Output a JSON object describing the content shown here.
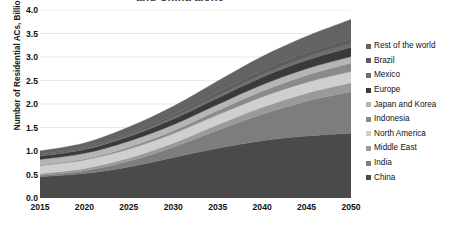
{
  "chart_data": {
    "type": "area",
    "stacked": true,
    "title": "and China alone",
    "title_clipped": true,
    "xlabel": "",
    "ylabel": "Number of Residential ACs, Billions",
    "xlim": [
      2015,
      2050
    ],
    "ylim": [
      0.0,
      4.0
    ],
    "grid": true,
    "legend_position": "right",
    "x": [
      2015,
      2020,
      2025,
      2030,
      2035,
      2040,
      2045,
      2050
    ],
    "xtick_labels": [
      "2015",
      "2020",
      "2025",
      "2030",
      "2035",
      "2040",
      "2045",
      "2050"
    ],
    "ytick_labels": [
      "0.0",
      "0.5",
      "1.0",
      "1.5",
      "2.0",
      "2.5",
      "3.0",
      "3.5",
      "4.0"
    ],
    "ytick_values": [
      0.0,
      0.5,
      1.0,
      1.5,
      2.0,
      2.5,
      3.0,
      3.5,
      4.0
    ],
    "stack_order_bottom_to_top": [
      "China",
      "India",
      "Middle East",
      "North America",
      "Indonesia",
      "Japan and Korea",
      "Europe",
      "Mexico",
      "Brazil",
      "Rest of the world"
    ],
    "series": [
      {
        "name": "China",
        "color": "#4a4a4a",
        "values": [
          0.45,
          0.52,
          0.66,
          0.86,
          1.06,
          1.22,
          1.32,
          1.38
        ]
      },
      {
        "name": "India",
        "color": "#7d7d7d",
        "values": [
          0.03,
          0.06,
          0.12,
          0.22,
          0.38,
          0.56,
          0.74,
          0.88
        ]
      },
      {
        "name": "Middle East",
        "color": "#9a9a9a",
        "values": [
          0.04,
          0.05,
          0.07,
          0.09,
          0.12,
          0.15,
          0.17,
          0.19
        ]
      },
      {
        "name": "North America",
        "color": "#cfcfcf",
        "values": [
          0.17,
          0.18,
          0.19,
          0.2,
          0.21,
          0.22,
          0.23,
          0.24
        ]
      },
      {
        "name": "Indonesia",
        "color": "#8a8a8a",
        "values": [
          0.01,
          0.02,
          0.04,
          0.06,
          0.09,
          0.12,
          0.15,
          0.18
        ]
      },
      {
        "name": "Japan and Korea",
        "color": "#b5b5b5",
        "values": [
          0.12,
          0.12,
          0.13,
          0.13,
          0.13,
          0.14,
          0.14,
          0.14
        ]
      },
      {
        "name": "Europe",
        "color": "#3a3a3a",
        "values": [
          0.07,
          0.08,
          0.1,
          0.12,
          0.14,
          0.16,
          0.18,
          0.2
        ]
      },
      {
        "name": "Mexico",
        "color": "#6e6e6e",
        "values": [
          0.02,
          0.02,
          0.03,
          0.04,
          0.05,
          0.06,
          0.07,
          0.08
        ]
      },
      {
        "name": "Brazil",
        "color": "#5c5c5c",
        "values": [
          0.02,
          0.03,
          0.04,
          0.05,
          0.07,
          0.08,
          0.09,
          0.1
        ]
      },
      {
        "name": "Rest of the world",
        "color": "#636363",
        "values": [
          0.07,
          0.09,
          0.13,
          0.18,
          0.24,
          0.3,
          0.35,
          0.41
        ]
      }
    ],
    "totals": [
      1.0,
      1.17,
      1.51,
      1.95,
      2.49,
      3.01,
      3.44,
      3.8
    ]
  },
  "legend": {
    "items": [
      {
        "label": "Rest of the world",
        "color": "#636363"
      },
      {
        "label": "Brazil",
        "color": "#5c5c5c"
      },
      {
        "label": "Mexico",
        "color": "#6e6e6e"
      },
      {
        "label": "Europe",
        "color": "#3a3a3a"
      },
      {
        "label": "Japan and Korea",
        "color": "#b5b5b5"
      },
      {
        "label": "Indonesia",
        "color": "#8a8a8a"
      },
      {
        "label": "North America",
        "color": "#cfcfcf"
      },
      {
        "label": "Middle East",
        "color": "#9a9a9a"
      },
      {
        "label": "India",
        "color": "#7d7d7d"
      },
      {
        "label": "China",
        "color": "#4a4a4a"
      }
    ]
  },
  "style": {
    "plot_background": "#ffffff",
    "gridline_color": "#e3e3e3",
    "text_color": "#111111"
  }
}
